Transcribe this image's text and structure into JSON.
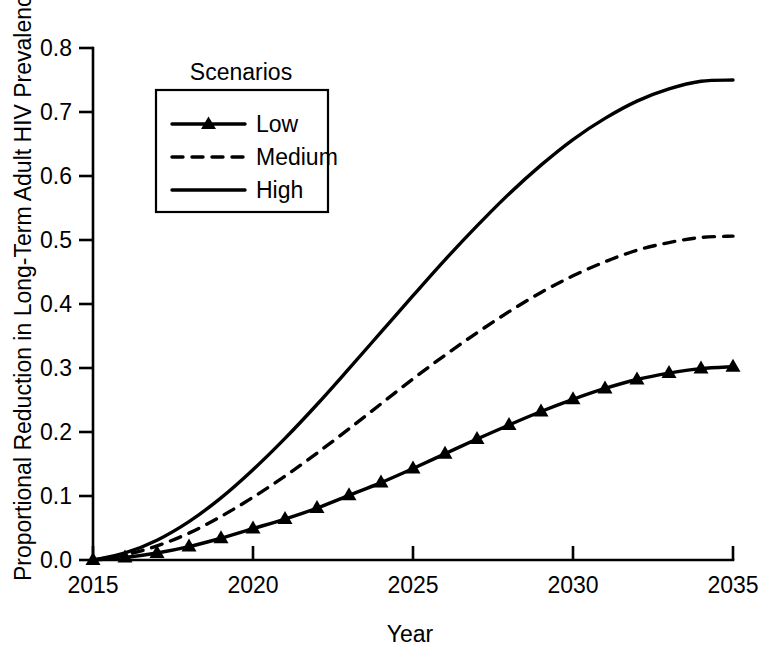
{
  "chart_data": {
    "type": "line",
    "title": "",
    "xlabel": "Year",
    "ylabel": "Proportional Reduction in Long-Term Adult HIV Prevalence",
    "x": [
      2015,
      2016,
      2017,
      2018,
      2019,
      2020,
      2021,
      2022,
      2023,
      2024,
      2025,
      2026,
      2027,
      2028,
      2029,
      2030,
      2031,
      2032,
      2033,
      2034,
      2035
    ],
    "xlim": [
      2015,
      2035
    ],
    "ylim": [
      0.0,
      0.8
    ],
    "xticks": [
      2015,
      2020,
      2025,
      2030,
      2035
    ],
    "xticklabels": [
      "2015",
      "2020",
      "2025",
      "2030",
      "2035"
    ],
    "yticks": [
      0.0,
      0.1,
      0.2,
      0.3,
      0.4,
      0.5,
      0.6,
      0.7,
      0.8
    ],
    "yticklabels": [
      "0.0",
      "0.1",
      "0.2",
      "0.3",
      "0.4",
      "0.5",
      "0.6",
      "0.7",
      "0.8"
    ],
    "grid": false,
    "legend_title": "Scenarios",
    "legend_position": "upper-left-inside",
    "series": [
      {
        "name": "Low",
        "style": "solid-with-triangle-markers",
        "marker": "triangle",
        "color": "#000000",
        "values": [
          0.0,
          0.004,
          0.011,
          0.021,
          0.034,
          0.049,
          0.064,
          0.081,
          0.101,
          0.121,
          0.143,
          0.166,
          0.189,
          0.211,
          0.232,
          0.251,
          0.268,
          0.282,
          0.292,
          0.299,
          0.302
        ]
      },
      {
        "name": "Medium",
        "style": "dashed",
        "marker": "none",
        "color": "#000000",
        "values": [
          0.0,
          0.008,
          0.022,
          0.042,
          0.068,
          0.098,
          0.131,
          0.167,
          0.205,
          0.244,
          0.283,
          0.32,
          0.355,
          0.388,
          0.418,
          0.444,
          0.466,
          0.484,
          0.496,
          0.504,
          0.506
        ]
      },
      {
        "name": "High",
        "style": "solid",
        "marker": "none",
        "color": "#000000",
        "values": [
          0.0,
          0.011,
          0.031,
          0.06,
          0.097,
          0.141,
          0.19,
          0.243,
          0.299,
          0.356,
          0.413,
          0.469,
          0.522,
          0.572,
          0.617,
          0.657,
          0.69,
          0.717,
          0.736,
          0.748,
          0.75
        ]
      }
    ]
  },
  "axes": {
    "x_title": "Year",
    "y_title": "Proportional Reduction in Long-Term Adult HIV Prevalence"
  },
  "legend": {
    "title": "Scenarios",
    "entries": [
      {
        "label": "Low"
      },
      {
        "label": "Medium"
      },
      {
        "label": "High"
      }
    ]
  }
}
